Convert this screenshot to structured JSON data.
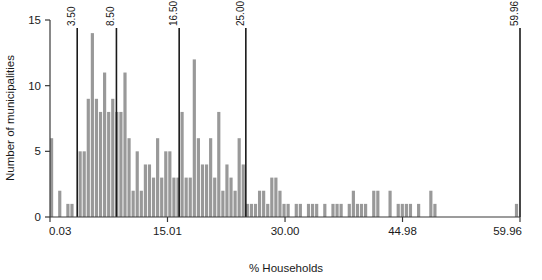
{
  "chart_data": {
    "type": "bar",
    "title": "",
    "subtitle": "",
    "xlabel": "% Households",
    "ylabel": "Number of municipalities",
    "xlim": [
      0.03,
      59.96
    ],
    "ylim": [
      0,
      15
    ],
    "grid": false,
    "legend": null,
    "bar_color": "#999999",
    "axis_color": "#3a3a3a",
    "divider_color": "#1a1a1a",
    "x_ticks": [
      {
        "value": 0.03,
        "label": "0.03"
      },
      {
        "value": 15.01,
        "label": "15.01"
      },
      {
        "value": 30.0,
        "label": "30.00"
      },
      {
        "value": 44.98,
        "label": "44.98"
      },
      {
        "value": 59.96,
        "label": "59.96"
      }
    ],
    "y_ticks": [
      {
        "value": 0,
        "label": "0"
      },
      {
        "value": 5,
        "label": "5"
      },
      {
        "value": 10,
        "label": "10"
      },
      {
        "value": 15,
        "label": "15"
      }
    ],
    "class_breaks": [
      {
        "value": 3.5,
        "label": "3.50"
      },
      {
        "value": 8.5,
        "label": "8.50"
      },
      {
        "value": 16.5,
        "label": "16.50"
      },
      {
        "value": 25.0,
        "label": "25.00"
      },
      {
        "value": 59.96,
        "label": "59.96"
      }
    ],
    "bin_width": 0.52,
    "bins": [
      {
        "x": 0.29,
        "count": 6
      },
      {
        "x": 0.81,
        "count": 0
      },
      {
        "x": 1.33,
        "count": 2
      },
      {
        "x": 1.85,
        "count": 0
      },
      {
        "x": 2.37,
        "count": 1
      },
      {
        "x": 2.89,
        "count": 1
      },
      {
        "x": 3.41,
        "count": 0
      },
      {
        "x": 3.93,
        "count": 5
      },
      {
        "x": 4.45,
        "count": 5
      },
      {
        "x": 4.97,
        "count": 9
      },
      {
        "x": 5.49,
        "count": 14
      },
      {
        "x": 6.01,
        "count": 9
      },
      {
        "x": 6.53,
        "count": 8
      },
      {
        "x": 7.05,
        "count": 11
      },
      {
        "x": 7.57,
        "count": 8
      },
      {
        "x": 8.09,
        "count": 9
      },
      {
        "x": 8.61,
        "count": 8
      },
      {
        "x": 9.13,
        "count": 8
      },
      {
        "x": 9.65,
        "count": 11
      },
      {
        "x": 10.17,
        "count": 6
      },
      {
        "x": 10.69,
        "count": 2
      },
      {
        "x": 11.21,
        "count": 5
      },
      {
        "x": 11.73,
        "count": 2
      },
      {
        "x": 12.25,
        "count": 4
      },
      {
        "x": 12.77,
        "count": 4
      },
      {
        "x": 13.29,
        "count": 3
      },
      {
        "x": 13.81,
        "count": 6
      },
      {
        "x": 14.33,
        "count": 3
      },
      {
        "x": 14.85,
        "count": 5
      },
      {
        "x": 15.37,
        "count": 5
      },
      {
        "x": 15.89,
        "count": 3
      },
      {
        "x": 16.41,
        "count": 3
      },
      {
        "x": 16.93,
        "count": 8
      },
      {
        "x": 17.45,
        "count": 3
      },
      {
        "x": 17.97,
        "count": 3
      },
      {
        "x": 18.49,
        "count": 12
      },
      {
        "x": 19.01,
        "count": 6
      },
      {
        "x": 19.53,
        "count": 4
      },
      {
        "x": 20.05,
        "count": 4
      },
      {
        "x": 20.57,
        "count": 6
      },
      {
        "x": 21.09,
        "count": 3
      },
      {
        "x": 21.61,
        "count": 8
      },
      {
        "x": 22.13,
        "count": 2
      },
      {
        "x": 22.65,
        "count": 4
      },
      {
        "x": 23.17,
        "count": 3
      },
      {
        "x": 23.69,
        "count": 2
      },
      {
        "x": 24.21,
        "count": 6
      },
      {
        "x": 24.73,
        "count": 4
      },
      {
        "x": 25.25,
        "count": 1
      },
      {
        "x": 25.77,
        "count": 1
      },
      {
        "x": 26.29,
        "count": 1
      },
      {
        "x": 26.81,
        "count": 2
      },
      {
        "x": 27.33,
        "count": 2
      },
      {
        "x": 27.85,
        "count": 1
      },
      {
        "x": 28.37,
        "count": 3
      },
      {
        "x": 28.89,
        "count": 3
      },
      {
        "x": 29.41,
        "count": 2
      },
      {
        "x": 29.93,
        "count": 1
      },
      {
        "x": 30.45,
        "count": 1
      },
      {
        "x": 30.97,
        "count": 0
      },
      {
        "x": 31.49,
        "count": 1
      },
      {
        "x": 32.01,
        "count": 1
      },
      {
        "x": 32.53,
        "count": 0
      },
      {
        "x": 33.05,
        "count": 1
      },
      {
        "x": 33.57,
        "count": 1
      },
      {
        "x": 34.09,
        "count": 1
      },
      {
        "x": 34.61,
        "count": 0
      },
      {
        "x": 35.13,
        "count": 1
      },
      {
        "x": 35.65,
        "count": 0
      },
      {
        "x": 36.17,
        "count": 1
      },
      {
        "x": 36.69,
        "count": 1
      },
      {
        "x": 37.21,
        "count": 1
      },
      {
        "x": 37.73,
        "count": 0
      },
      {
        "x": 38.25,
        "count": 1
      },
      {
        "x": 38.77,
        "count": 2
      },
      {
        "x": 39.29,
        "count": 1
      },
      {
        "x": 39.81,
        "count": 1
      },
      {
        "x": 40.33,
        "count": 1
      },
      {
        "x": 40.85,
        "count": 0
      },
      {
        "x": 41.37,
        "count": 2
      },
      {
        "x": 41.89,
        "count": 2
      },
      {
        "x": 42.41,
        "count": 0
      },
      {
        "x": 42.93,
        "count": 0
      },
      {
        "x": 43.45,
        "count": 2
      },
      {
        "x": 43.97,
        "count": 0
      },
      {
        "x": 44.49,
        "count": 1
      },
      {
        "x": 45.01,
        "count": 1
      },
      {
        "x": 45.53,
        "count": 1
      },
      {
        "x": 46.05,
        "count": 1
      },
      {
        "x": 46.57,
        "count": 0
      },
      {
        "x": 47.09,
        "count": 1
      },
      {
        "x": 47.61,
        "count": 0
      },
      {
        "x": 48.13,
        "count": 0
      },
      {
        "x": 48.65,
        "count": 2
      },
      {
        "x": 49.17,
        "count": 1
      },
      {
        "x": 49.69,
        "count": 0
      },
      {
        "x": 50.21,
        "count": 0
      },
      {
        "x": 50.73,
        "count": 0
      },
      {
        "x": 51.25,
        "count": 0
      },
      {
        "x": 51.77,
        "count": 0
      },
      {
        "x": 52.29,
        "count": 0
      },
      {
        "x": 52.81,
        "count": 0
      },
      {
        "x": 53.33,
        "count": 0
      },
      {
        "x": 53.85,
        "count": 0
      },
      {
        "x": 54.37,
        "count": 0
      },
      {
        "x": 54.89,
        "count": 0
      },
      {
        "x": 55.41,
        "count": 0
      },
      {
        "x": 55.93,
        "count": 0
      },
      {
        "x": 56.45,
        "count": 0
      },
      {
        "x": 56.97,
        "count": 0
      },
      {
        "x": 57.49,
        "count": 0
      },
      {
        "x": 58.01,
        "count": 0
      },
      {
        "x": 58.53,
        "count": 0
      },
      {
        "x": 59.05,
        "count": 0
      },
      {
        "x": 59.57,
        "count": 1
      }
    ]
  }
}
